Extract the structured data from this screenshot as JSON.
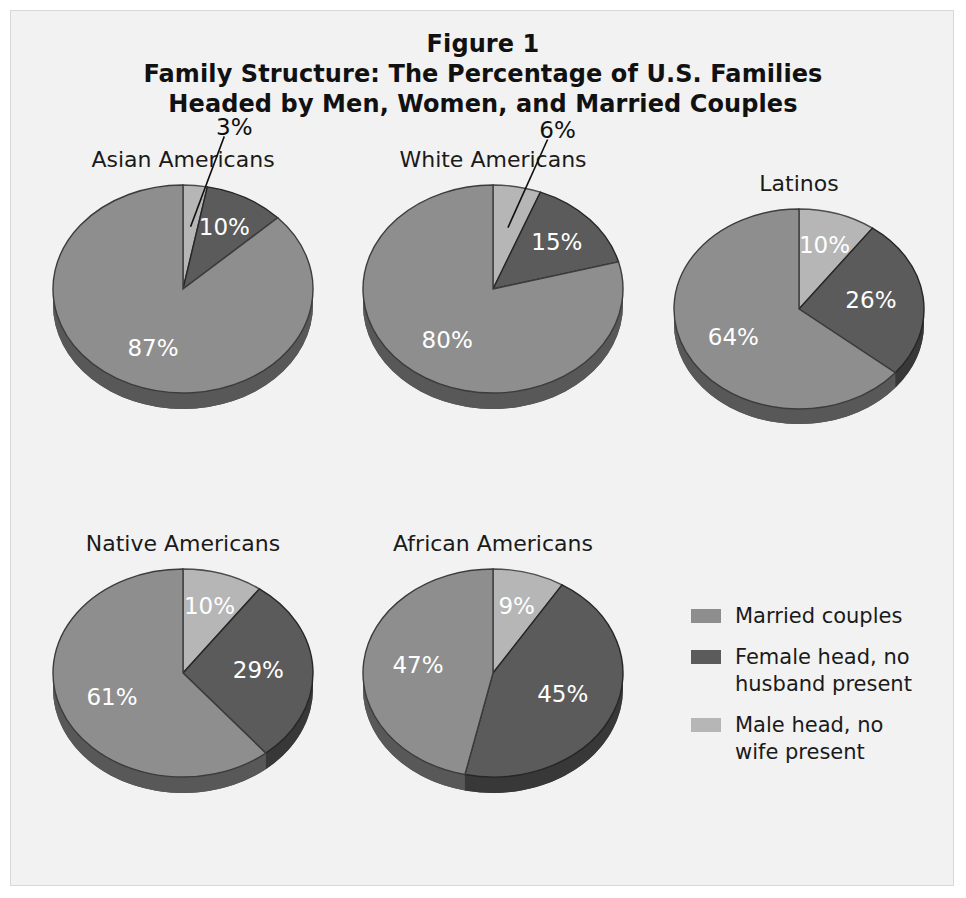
{
  "figure": {
    "title_lines": [
      "Figure 1",
      "Family Structure: The Percentage of U.S. Families",
      "Headed by Men, Women, and Married Couples"
    ]
  },
  "colors": {
    "married": "#8e8e8e",
    "female_head": "#5b5b5b",
    "male_head": "#b6b6b6",
    "depth_shadow": "#454545",
    "background": "#f2f2f2",
    "label_light": "#ffffff",
    "label_dark": "#101010"
  },
  "legend": {
    "items": [
      {
        "label": "Married couples",
        "color": "#8e8e8e",
        "key": "married"
      },
      {
        "label": "Female head, no husband present",
        "color": "#5b5b5b",
        "key": "female_head"
      },
      {
        "label": "Male head, no wife present",
        "color": "#b6b6b6",
        "key": "male_head"
      }
    ]
  },
  "chart_data": {
    "type": "pie",
    "unit": "percent",
    "categories": [
      "Male head, no wife present",
      "Female head, no husband present",
      "Married couples"
    ],
    "legend_position": "right-bottom",
    "charts": [
      {
        "name": "Asian Americans",
        "slices": [
          {
            "key": "male_head",
            "label": "3%",
            "value": 3,
            "label_style": "outside",
            "leader": true
          },
          {
            "key": "female_head",
            "label": "10%",
            "value": 10,
            "label_style": "inside"
          },
          {
            "key": "married",
            "label": "87%",
            "value": 87,
            "label_style": "inside"
          }
        ]
      },
      {
        "name": "White Americans",
        "slices": [
          {
            "key": "male_head",
            "label": "6%",
            "value": 6,
            "label_style": "outside",
            "leader": true
          },
          {
            "key": "female_head",
            "label": "15%",
            "value": 15,
            "label_style": "inside"
          },
          {
            "key": "married",
            "label": "80%",
            "value": 80,
            "label_style": "inside"
          }
        ]
      },
      {
        "name": "Latinos",
        "slices": [
          {
            "key": "male_head",
            "label": "10%",
            "value": 10,
            "label_style": "inside"
          },
          {
            "key": "female_head",
            "label": "26%",
            "value": 26,
            "label_style": "inside"
          },
          {
            "key": "married",
            "label": "64%",
            "value": 64,
            "label_style": "inside"
          }
        ]
      },
      {
        "name": "Native Americans",
        "slices": [
          {
            "key": "male_head",
            "label": "10%",
            "value": 10,
            "label_style": "inside"
          },
          {
            "key": "female_head",
            "label": "29%",
            "value": 29,
            "label_style": "inside"
          },
          {
            "key": "married",
            "label": "61%",
            "value": 61,
            "label_style": "inside"
          }
        ]
      },
      {
        "name": "African Americans",
        "slices": [
          {
            "key": "male_head",
            "label": "9%",
            "value": 9,
            "label_style": "inside"
          },
          {
            "key": "female_head",
            "label": "45%",
            "value": 45,
            "label_style": "inside"
          },
          {
            "key": "married",
            "label": "47%",
            "value": 47,
            "label_style": "inside"
          }
        ]
      }
    ]
  },
  "layout": {
    "panels": [
      {
        "chart": 0,
        "left": 22,
        "top": 136,
        "width": 300,
        "radius": 130,
        "depth": 16,
        "tilt": 0.8
      },
      {
        "chart": 1,
        "left": 332,
        "top": 136,
        "width": 300,
        "radius": 130,
        "depth": 16,
        "tilt": 0.8
      },
      {
        "chart": 2,
        "left": 638,
        "top": 160,
        "width": 300,
        "radius": 125,
        "depth": 15,
        "tilt": 0.8
      },
      {
        "chart": 3,
        "left": 22,
        "top": 520,
        "width": 300,
        "radius": 130,
        "depth": 16,
        "tilt": 0.8
      },
      {
        "chart": 4,
        "left": 332,
        "top": 520,
        "width": 300,
        "radius": 130,
        "depth": 16,
        "tilt": 0.8
      }
    ]
  }
}
